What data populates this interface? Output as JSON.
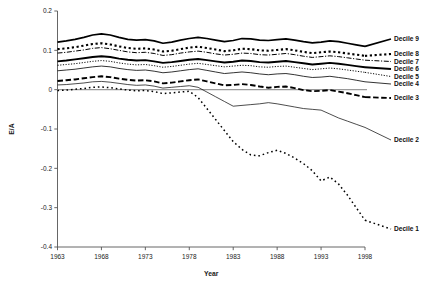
{
  "chart_data": {
    "type": "line",
    "title": "",
    "xlabel": "Year",
    "ylabel": "E/A",
    "xlim": [
      1963,
      1998
    ],
    "ylim": [
      -0.4,
      0.2
    ],
    "grid": false,
    "legend_position": "right",
    "x_ticks": [
      "1963",
      "1968",
      "1973",
      "1978",
      "1983",
      "1988",
      "1993",
      "1998"
    ],
    "x_tick_values": [
      1963,
      1968,
      1973,
      1978,
      1983,
      1988,
      1993,
      1998
    ],
    "y_ticks": [
      "0.2",
      "0.1",
      "0",
      "-0.1",
      "-0.2",
      "-0.3",
      "-0.4"
    ],
    "y_tick_values": [
      0.2,
      0.1,
      0,
      -0.1,
      -0.2,
      -0.3,
      -0.4
    ],
    "x": [
      1963,
      1964,
      1965,
      1966,
      1967,
      1968,
      1969,
      1970,
      1971,
      1972,
      1973,
      1974,
      1975,
      1976,
      1977,
      1978,
      1979,
      1980,
      1981,
      1982,
      1983,
      1984,
      1985,
      1986,
      1987,
      1988,
      1989,
      1990,
      1991,
      1992,
      1993,
      1994,
      1995,
      1996,
      1997,
      1998
    ],
    "series": [
      {
        "name": "Decile 9",
        "style": "solid-thick",
        "values": [
          0.121,
          0.124,
          0.128,
          0.133,
          0.139,
          0.142,
          0.139,
          0.133,
          0.128,
          0.126,
          0.127,
          0.124,
          0.118,
          0.121,
          0.126,
          0.13,
          0.133,
          0.13,
          0.126,
          0.122,
          0.125,
          0.13,
          0.129,
          0.126,
          0.125,
          0.127,
          0.129,
          0.126,
          0.122,
          0.119,
          0.121,
          0.124,
          0.122,
          0.118,
          0.114,
          0.11
        ]
      },
      {
        "name": "Decile 8",
        "style": "dotted-square",
        "values": [
          0.103,
          0.105,
          0.108,
          0.112,
          0.116,
          0.118,
          0.115,
          0.11,
          0.106,
          0.104,
          0.105,
          0.102,
          0.097,
          0.099,
          0.103,
          0.107,
          0.109,
          0.106,
          0.102,
          0.098,
          0.1,
          0.104,
          0.103,
          0.1,
          0.099,
          0.101,
          0.103,
          0.1,
          0.096,
          0.093,
          0.095,
          0.097,
          0.095,
          0.092,
          0.089,
          0.086
        ]
      },
      {
        "name": "Decile 7",
        "style": "dash-dot",
        "values": [
          0.093,
          0.095,
          0.098,
          0.101,
          0.105,
          0.107,
          0.104,
          0.1,
          0.096,
          0.094,
          0.095,
          0.092,
          0.087,
          0.089,
          0.093,
          0.096,
          0.098,
          0.095,
          0.091,
          0.088,
          0.09,
          0.093,
          0.092,
          0.089,
          0.088,
          0.09,
          0.092,
          0.089,
          0.085,
          0.082,
          0.084,
          0.086,
          0.084,
          0.081,
          0.078,
          0.075
        ]
      },
      {
        "name": "Decile 6",
        "style": "solid-bold",
        "values": [
          0.072,
          0.074,
          0.077,
          0.08,
          0.083,
          0.085,
          0.083,
          0.079,
          0.076,
          0.074,
          0.075,
          0.072,
          0.068,
          0.07,
          0.073,
          0.076,
          0.078,
          0.075,
          0.072,
          0.069,
          0.071,
          0.074,
          0.073,
          0.07,
          0.069,
          0.071,
          0.073,
          0.07,
          0.067,
          0.064,
          0.066,
          0.068,
          0.066,
          0.063,
          0.06,
          0.057
        ]
      },
      {
        "name": "Decile 5",
        "style": "dotted-fine",
        "values": [
          0.062,
          0.064,
          0.066,
          0.069,
          0.072,
          0.074,
          0.072,
          0.068,
          0.065,
          0.063,
          0.064,
          0.061,
          0.057,
          0.059,
          0.062,
          0.065,
          0.067,
          0.064,
          0.061,
          0.058,
          0.06,
          0.062,
          0.061,
          0.058,
          0.057,
          0.059,
          0.06,
          0.057,
          0.054,
          0.051,
          0.053,
          0.055,
          0.053,
          0.05,
          0.047,
          0.044
        ]
      },
      {
        "name": "Decile 4",
        "style": "solid-thin",
        "values": [
          0.048,
          0.05,
          0.052,
          0.055,
          0.058,
          0.06,
          0.058,
          0.054,
          0.051,
          0.049,
          0.05,
          0.047,
          0.043,
          0.045,
          0.048,
          0.051,
          0.053,
          0.049,
          0.045,
          0.041,
          0.043,
          0.045,
          0.043,
          0.04,
          0.038,
          0.04,
          0.041,
          0.038,
          0.034,
          0.031,
          0.032,
          0.034,
          0.031,
          0.028,
          0.024,
          0.02
        ]
      },
      {
        "name": "Decile 3",
        "style": "dashed-thick",
        "values": [
          0.022,
          0.024,
          0.026,
          0.029,
          0.032,
          0.034,
          0.032,
          0.028,
          0.025,
          0.023,
          0.024,
          0.021,
          0.016,
          0.018,
          0.021,
          0.024,
          0.026,
          0.021,
          0.016,
          0.011,
          0.012,
          0.014,
          0.012,
          0.008,
          0.005,
          0.007,
          0.008,
          0.004,
          -0.001,
          -0.004,
          -0.003,
          -0.001,
          -0.005,
          -0.009,
          -0.014,
          -0.019
        ]
      },
      {
        "name": "Decile 2",
        "style": "solid-hair",
        "values": [
          0.012,
          0.013,
          0.015,
          0.017,
          0.02,
          0.021,
          0.019,
          0.016,
          0.013,
          0.011,
          0.012,
          0.009,
          0.004,
          0.006,
          0.008,
          0.01,
          0.006,
          -0.006,
          -0.018,
          -0.03,
          -0.042,
          -0.04,
          -0.038,
          -0.036,
          -0.033,
          -0.036,
          -0.04,
          -0.044,
          -0.048,
          -0.05,
          -0.052,
          -0.062,
          -0.072,
          -0.08,
          -0.088,
          -0.096
        ]
      },
      {
        "name": "Decile 1",
        "style": "dotted-sparse",
        "values": [
          -0.002,
          -0.001,
          0.001,
          0.003,
          0.006,
          0.007,
          0.005,
          0.002,
          -0.001,
          -0.003,
          -0.002,
          -0.005,
          -0.01,
          -0.008,
          -0.006,
          -0.004,
          -0.02,
          -0.048,
          -0.076,
          -0.104,
          -0.132,
          -0.152,
          -0.166,
          -0.168,
          -0.16,
          -0.154,
          -0.162,
          -0.174,
          -0.188,
          -0.206,
          -0.232,
          -0.222,
          -0.24,
          -0.268,
          -0.3,
          -0.332
        ]
      }
    ]
  },
  "legend": {
    "entries": [
      {
        "label": "Decile 9"
      },
      {
        "label": "Decile 8"
      },
      {
        "label": "Decile 7"
      },
      {
        "label": "Decile 6"
      },
      {
        "label": "Decile 5"
      },
      {
        "label": "Decile 4"
      },
      {
        "label": "Decile 3"
      },
      {
        "label": "Decile 2"
      },
      {
        "label": "Decile 1"
      }
    ]
  }
}
